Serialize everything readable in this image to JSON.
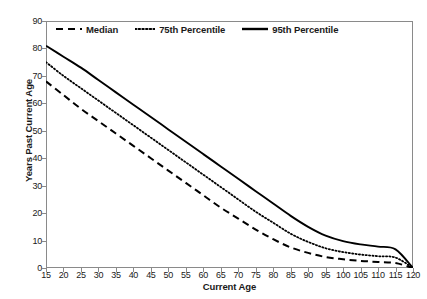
{
  "chart_data": {
    "type": "line",
    "title": "",
    "xlabel": "Current Age",
    "ylabel": "Years Past Current Age",
    "xlim": [
      15,
      120
    ],
    "ylim": [
      0,
      90
    ],
    "xticks": [
      15,
      20,
      25,
      30,
      35,
      40,
      45,
      50,
      55,
      60,
      65,
      70,
      75,
      80,
      85,
      90,
      95,
      100,
      105,
      110,
      115,
      120
    ],
    "yticks": [
      0,
      10,
      20,
      30,
      40,
      50,
      60,
      70,
      80,
      90
    ],
    "grid": false,
    "legend_position": "top-left-inside",
    "x": [
      15,
      20,
      25,
      30,
      35,
      40,
      45,
      50,
      55,
      60,
      65,
      70,
      75,
      80,
      85,
      90,
      95,
      100,
      105,
      110,
      115,
      120
    ],
    "series": [
      {
        "name": "Median",
        "linestyle": "dashed",
        "color": "#000000",
        "values": [
          68,
          63,
          58,
          53.5,
          49,
          44.5,
          40,
          35.5,
          31,
          26.5,
          22,
          18,
          14,
          10.5,
          7.5,
          5.5,
          4,
          3.2,
          2.6,
          2.2,
          1.8,
          0
        ]
      },
      {
        "name": "75th Percentile",
        "linestyle": "dotted",
        "color": "#000000",
        "values": [
          75,
          70,
          65.5,
          61,
          56.5,
          52,
          47.5,
          43,
          38.5,
          34,
          29.5,
          25,
          20.5,
          16.5,
          12.5,
          9.5,
          7.2,
          5.8,
          4.9,
          4.3,
          3.8,
          0
        ]
      },
      {
        "name": "95th Percentile",
        "linestyle": "solid",
        "color": "#000000",
        "values": [
          81,
          77,
          73,
          68.5,
          64,
          59.5,
          55,
          50.5,
          46,
          41.5,
          37,
          32.5,
          28,
          23.5,
          19,
          15,
          11.8,
          9.8,
          8.6,
          7.8,
          6.8,
          0
        ]
      }
    ]
  },
  "axis": {
    "x_title": "Current Age",
    "y_title": "Years Past Current Age"
  },
  "legend": {
    "items": [
      {
        "label": "Median",
        "style": "dashed"
      },
      {
        "label": "75th Percentile",
        "style": "dotted"
      },
      {
        "label": "95th Percentile",
        "style": "solid"
      }
    ]
  },
  "colors": {
    "line": "#000000",
    "axis": "#8a8a8a",
    "text": "#1a1a1a",
    "background": "#ffffff"
  }
}
